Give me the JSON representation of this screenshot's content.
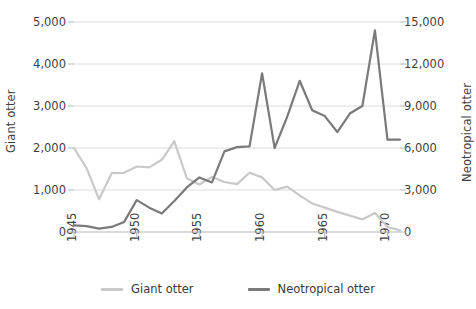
{
  "chart_data": {
    "type": "line",
    "title": "",
    "subtitle": "",
    "xlabel": "",
    "ylabel": "Giant otter",
    "y2label": "Neotropical otter",
    "grid": true,
    "legend_position": "bottom",
    "x": [
      1945,
      1946,
      1947,
      1948,
      1949,
      1950,
      1951,
      1952,
      1953,
      1954,
      1955,
      1956,
      1957,
      1958,
      1959,
      1960,
      1961,
      1962,
      1963,
      1964,
      1965,
      1966,
      1967,
      1968,
      1969,
      1970,
      1971
    ],
    "xlim": [
      1945,
      1971
    ],
    "xticks": [
      1945,
      1950,
      1955,
      1960,
      1965,
      1970
    ],
    "xticklabels": [
      "1945",
      "1950",
      "1955",
      "1960",
      "1965",
      "1970"
    ],
    "ylim": [
      0,
      5000
    ],
    "yticks": [
      0,
      1000,
      2000,
      3000,
      4000,
      5000
    ],
    "yticklabels": [
      "0",
      "1,000",
      "2,000",
      "3,000",
      "4,000",
      "5,000"
    ],
    "y2lim": [
      0,
      15000
    ],
    "y2ticks": [
      0,
      3000,
      6000,
      9000,
      12000,
      15000
    ],
    "y2ticklabels": [
      "0",
      "3,000",
      "6,000",
      "9,000",
      "12,000",
      "15,000"
    ],
    "series": [
      {
        "name": "Giant otter",
        "axis": "left",
        "color": "#c9c9c9",
        "values": [
          2000,
          1520,
          780,
          1400,
          1410,
          1560,
          1540,
          1720,
          2160,
          1280,
          1130,
          1310,
          1190,
          1140,
          1410,
          1300,
          1000,
          1080,
          870,
          680,
          580,
          480,
          390,
          300,
          450,
          120,
          40
        ]
      },
      {
        "name": "Neotropical otter",
        "axis": "right",
        "color": "#7a7a7a",
        "values": [
          480,
          420,
          240,
          360,
          720,
          2280,
          1740,
          1320,
          2220,
          3180,
          3900,
          3540,
          5760,
          6060,
          6120,
          11340,
          6000,
          8220,
          10800,
          8700,
          8280,
          7140,
          8460,
          9000,
          14400,
          6600,
          6600
        ]
      }
    ]
  },
  "legend": {
    "items": [
      {
        "label": "Giant otter",
        "color": "#c9c9c9"
      },
      {
        "label": "Neotropical otter",
        "color": "#7a7a7a"
      }
    ]
  },
  "colors": {
    "giant_otter": "#c9c9c9",
    "neotropical_otter": "#7a7a7a",
    "gridline": "#dcdcdc",
    "axis": "#b5b5b5",
    "text": "#3a3a3a",
    "background": "#ffffff"
  }
}
